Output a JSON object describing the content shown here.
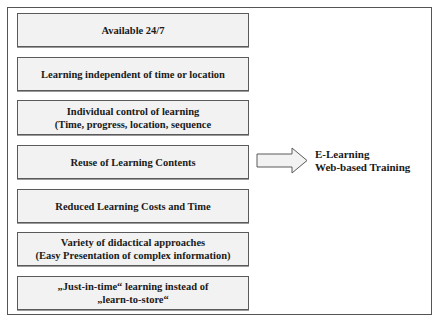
{
  "diagram": {
    "benefits": [
      {
        "lines": [
          "Available 24/7"
        ]
      },
      {
        "lines": [
          "Learning independent of time or location"
        ]
      },
      {
        "lines": [
          "Individual control of learning",
          "(Time, progress, location, sequence"
        ]
      },
      {
        "lines": [
          "Reuse of Learning Contents"
        ]
      },
      {
        "lines": [
          "Reduced Learning Costs and Time"
        ]
      },
      {
        "lines": [
          "Variety of didactical approaches",
          "(Easy Presentation of complex information)"
        ]
      },
      {
        "lines": [
          "„Just-in-time“ learning instead of",
          "„learn-to-store“"
        ]
      }
    ],
    "arrow": {
      "icon": "right-block-arrow-icon",
      "fill": "#f2f2f2",
      "stroke": "#5a5a5a"
    },
    "result": {
      "lines": [
        "E-Learning",
        "Web-based Training"
      ]
    },
    "colors": {
      "box_fill": "#f2f2f2",
      "box_border": "#5a5a5a",
      "frame_border": "#555555",
      "text": "#1a1a1a"
    }
  }
}
